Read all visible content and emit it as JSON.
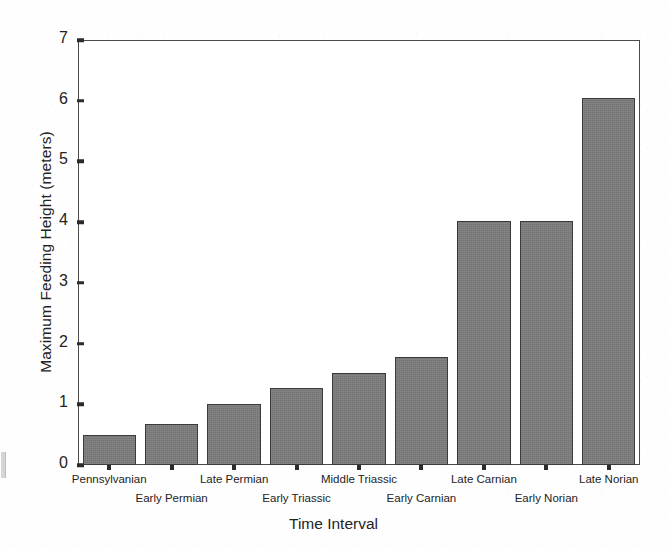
{
  "chart_data": {
    "type": "bar",
    "title": "",
    "xlabel": "Time Interval",
    "ylabel": "Maximum Feeding Height (meters)",
    "categories": [
      "Pennsylvanian",
      "Early Permian",
      "Late Permian",
      "Early Triassic",
      "Middle Triassic",
      "Early Carnian",
      "Late Carnian",
      "Early Norian",
      "Late Norian"
    ],
    "values": [
      0.5,
      0.67,
      1.01,
      1.27,
      1.52,
      1.78,
      4.02,
      4.02,
      6.05
    ],
    "ylim": [
      0,
      7
    ],
    "yticks": [
      0,
      1,
      2,
      3,
      4,
      5,
      6,
      7
    ],
    "ytick_labels": [
      "0",
      "1",
      "2",
      "3",
      "4",
      "5",
      "6",
      "7"
    ],
    "grid": false,
    "legend": null,
    "bar_color": "#7a7a7a",
    "bar_edge_color": "#3b3b3b",
    "axis_color": "#4a4a4a",
    "background_color": "#ffffff",
    "label_rows": [
      0,
      1,
      0,
      1,
      0,
      1,
      0,
      1,
      0
    ]
  }
}
